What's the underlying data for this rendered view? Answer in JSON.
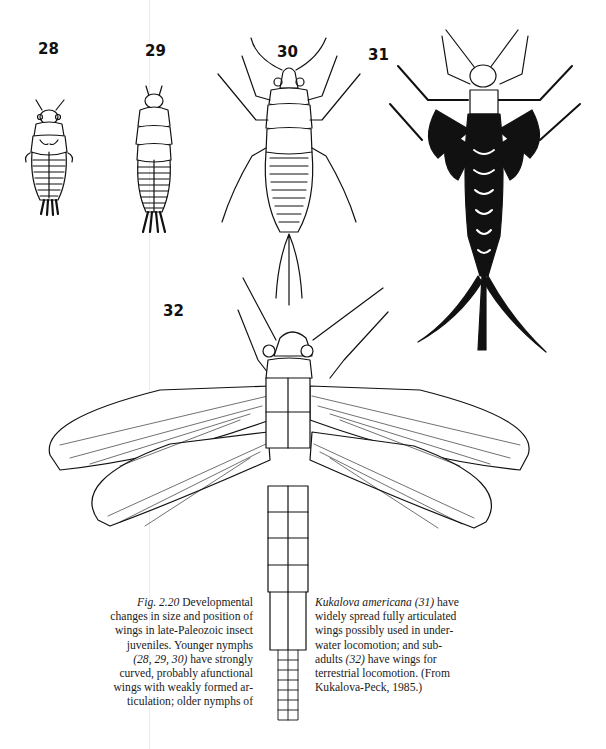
{
  "figure": {
    "number": "Fig. 2.20",
    "panels": [
      {
        "id": "28",
        "label": "28",
        "description": "young nymph, short body with small curved wing pads"
      },
      {
        "id": "29",
        "label": "29",
        "description": "young nymph, elongated body with curved wing pads"
      },
      {
        "id": "30",
        "label": "30",
        "description": "young nymph with long legs, antennae and cerci"
      },
      {
        "id": "31",
        "label": "31",
        "description": "older nymph of Kukalova americana, dark, widely spread wings"
      },
      {
        "id": "32",
        "label": "32",
        "description": "subadult with four large veined wings"
      }
    ]
  },
  "caption": {
    "left_lines": [
      {
        "italic": "Fig. 2.20",
        "text": "  Developmental"
      },
      {
        "text": "changes in size and position of"
      },
      {
        "text": "wings in late-Paleozoic insect"
      },
      {
        "text": "juveniles. Younger nymphs"
      },
      {
        "italic": "(28, 29, 30)",
        "text": " have strongly"
      },
      {
        "text": "curved, probably afunctional"
      },
      {
        "text": "wings with weakly formed ar-"
      },
      {
        "text": "ticulation; older nymphs of"
      }
    ],
    "right_lines": [
      {
        "italic": "Kukalova americana (31)",
        "text": " have"
      },
      {
        "text": "widely spread fully articulated"
      },
      {
        "text": "wings possibly used in under-"
      },
      {
        "text": "water locomotion; and sub-"
      },
      {
        "text": "adults ",
        "italic_after": "(32)",
        "text_after": " have wings for"
      },
      {
        "text": "terrestrial locomotion. (From"
      },
      {
        "text": "Kukalova-Peck, 1985.)"
      }
    ]
  }
}
